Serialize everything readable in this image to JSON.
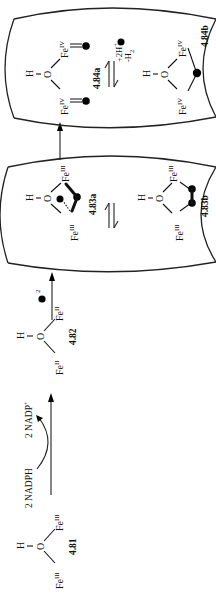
{
  "diagram": {
    "type": "reaction-scheme",
    "orientation": "rotated-90-counterclockwise",
    "compounds": [
      {
        "id": "4.81",
        "label": "4.81",
        "atoms": {
          "h": "H",
          "o": "O",
          "fe_left": "Fe",
          "fe_left_ox": "III",
          "fe_right": "Fe",
          "fe_right_ox": "III"
        }
      },
      {
        "id": "4.82",
        "label": "4.82",
        "atoms": {
          "h": "H",
          "o": "O",
          "fe_left": "Fe",
          "fe_left_ox": "II",
          "fe_right": "Fe",
          "fe_right_ox": "II"
        }
      },
      {
        "id": "4.83a",
        "label": "4.83a",
        "atoms": {
          "h": "H",
          "o": "O",
          "fe_left": "Fe",
          "fe_left_ox": "III",
          "fe_right": "Fe",
          "fe_right_ox": "III"
        }
      },
      {
        "id": "4.83b",
        "label": "4.83b",
        "atoms": {
          "h": "H",
          "o": "O",
          "fe_left": "Fe",
          "fe_left_ox": "III",
          "fe_right": "Fe",
          "fe_right_ox": "III"
        }
      },
      {
        "id": "4.84a",
        "label": "4.84a",
        "atoms": {
          "h": "H",
          "o": "O",
          "fe_left": "Fe",
          "fe_left_ox": "IV",
          "fe_right": "Fe",
          "fe_right_ox": "IV"
        }
      },
      {
        "id": "4.84b",
        "label": "4.84b",
        "atoms": {
          "h": "H",
          "o": "O",
          "fe_left": "Fe",
          "fe_left_ox": "IV",
          "fe_right": "Fe",
          "fe_right_ox": "IV"
        }
      }
    ],
    "reagents": {
      "step1_in": "2 NADPH",
      "step1_out": "2 NADP",
      "step1_out_charge": "+",
      "step2_subscript": "2",
      "equilibrium2_top": "+2H",
      "equilibrium2_top_charge": "+",
      "equilibrium2_bottom": "-H",
      "equilibrium2_bottom_subscript": "2"
    },
    "arrows": [
      {
        "from": "4.81",
        "to": "4.82",
        "type": "forward"
      },
      {
        "from": "4.82",
        "to": "4.83a",
        "type": "forward"
      },
      {
        "from": "4.83a",
        "to": "4.83b",
        "type": "equilibrium"
      },
      {
        "from": "4.83",
        "to": "4.84",
        "type": "forward"
      },
      {
        "from": "4.84a",
        "to": "4.84b",
        "type": "equilibrium"
      }
    ]
  }
}
